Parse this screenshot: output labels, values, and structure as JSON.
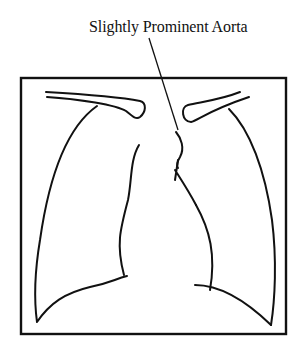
{
  "diagram": {
    "type": "chest-xray-schematic",
    "annotation": {
      "label": "Slightly Prominent Aorta",
      "points_to": "aortic-knob"
    },
    "structures": [
      "frame",
      "right-clavicle",
      "left-clavicle",
      "right-lung-outline",
      "left-lung-outline",
      "mediastinum-right-border",
      "aortic-knob",
      "heart-left-border",
      "left-hemidiaphragm"
    ],
    "colors": {
      "line": "#111111",
      "background": "#ffffff"
    }
  }
}
